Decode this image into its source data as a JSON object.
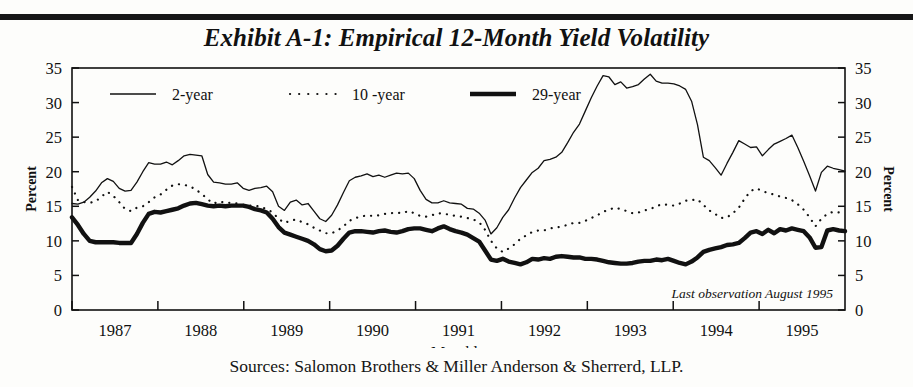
{
  "title": "Exhibit A-1: Empirical 12-Month Yield Volatility",
  "source_note": "Sources: Salomon Brothers & Miller Anderson & Sherrerd, LLP.",
  "annotation": "Last observation August 1995",
  "axis": {
    "y_left_title": "Percent",
    "y_right_title": "Percent",
    "x_title": "Monthly",
    "y_ticks": [
      "0",
      "5",
      "10",
      "15",
      "20",
      "25",
      "30",
      "35"
    ],
    "x_ticks": [
      "1987",
      "1988",
      "1989",
      "1990",
      "1991",
      "1992",
      "1993",
      "1994",
      "1995"
    ]
  },
  "legend": {
    "items": [
      {
        "label": "2-year",
        "style": "thin-solid"
      },
      {
        "label": "10 -year",
        "style": "dotted"
      },
      {
        "label": "29-year",
        "style": "thick-solid"
      }
    ]
  },
  "colors": {
    "ink": "#111111",
    "paper": "#fdfdfb",
    "rule": "#171717"
  },
  "chart_data": {
    "type": "line",
    "title": "Exhibit A-1: Empirical 12-Month Yield Volatility",
    "xlabel": "Monthly",
    "ylabel": "Percent",
    "ylim": [
      0,
      35
    ],
    "grid": false,
    "legend_position": "top-inside",
    "annotations": [
      "Last observation August 1995"
    ],
    "x_tick_labels": [
      "1987",
      "1988",
      "1989",
      "1990",
      "1991",
      "1992",
      "1993",
      "1994",
      "1995"
    ],
    "x_start": "1986-08",
    "x_end": "1995-08",
    "x_step": "1 month",
    "series": [
      {
        "name": "2-year",
        "values": [
          15.4,
          15.3,
          15.6,
          16.3,
          17.2,
          18.4,
          19.0,
          18.6,
          17.6,
          17.2,
          17.3,
          18.5,
          20.0,
          21.3,
          21.1,
          21.1,
          21.4,
          21.0,
          21.6,
          22.3,
          22.5,
          22.4,
          22.3,
          19.6,
          18.5,
          18.4,
          18.2,
          18.2,
          18.4,
          17.6,
          17.3,
          17.6,
          17.7,
          17.9,
          17.1,
          15.0,
          14.4,
          15.6,
          15.9,
          15.2,
          15.4,
          14.3,
          13.2,
          12.8,
          13.7,
          15.2,
          17.0,
          18.7,
          19.2,
          19.4,
          19.7,
          19.3,
          19.5,
          19.2,
          19.5,
          19.8,
          19.7,
          19.8,
          19.0,
          17.3,
          16.0,
          15.5,
          15.5,
          15.8,
          15.5,
          15.4,
          15.3,
          14.7,
          14.6,
          14.0,
          13.0,
          11.0,
          11.9,
          13.4,
          14.5,
          16.2,
          17.7,
          18.8,
          19.9,
          20.5,
          21.6,
          21.8,
          22.1,
          22.8,
          24.2,
          25.7,
          26.9,
          28.8,
          30.7,
          32.4,
          33.9,
          33.7,
          32.6,
          33.0,
          32.1,
          32.3,
          32.6,
          33.4,
          34.1,
          33.1,
          32.8,
          32.8,
          32.7,
          32.4,
          31.9,
          30.2,
          26.8,
          22.1,
          21.6,
          20.6,
          19.5,
          21.2,
          22.8,
          24.5,
          24.0,
          23.5,
          23.6,
          22.3,
          23.2,
          24.0,
          24.4,
          24.8,
          25.3,
          23.5,
          21.5,
          19.4,
          17.2,
          19.9,
          20.8,
          20.5,
          20.3,
          20.1
        ]
      },
      {
        "name": "10 -year",
        "values": [
          17.8,
          15.9,
          15.6,
          15.5,
          15.7,
          16.4,
          17.1,
          16.5,
          15.6,
          14.6,
          14.3,
          14.8,
          15.0,
          15.6,
          16.3,
          16.7,
          17.4,
          18.0,
          18.2,
          18.1,
          17.9,
          17.4,
          16.8,
          16.0,
          15.4,
          15.7,
          15.5,
          15.5,
          15.4,
          15.2,
          15.1,
          15.1,
          14.9,
          14.6,
          14.1,
          13.2,
          12.6,
          12.9,
          13.1,
          12.7,
          12.4,
          11.9,
          11.5,
          11.1,
          11.1,
          11.5,
          12.1,
          12.9,
          13.3,
          13.5,
          13.7,
          13.6,
          13.7,
          13.9,
          14.0,
          14.1,
          14.0,
          14.3,
          14.0,
          13.6,
          13.5,
          13.7,
          14.0,
          13.9,
          13.8,
          13.6,
          13.5,
          13.3,
          13.1,
          12.7,
          11.6,
          10.0,
          8.9,
          8.4,
          8.9,
          9.5,
          10.3,
          10.8,
          11.3,
          11.5,
          11.5,
          11.8,
          11.9,
          12.1,
          12.3,
          12.6,
          12.6,
          12.9,
          13.3,
          13.7,
          14.2,
          14.5,
          14.8,
          14.6,
          14.3,
          14.0,
          14.1,
          14.4,
          14.6,
          15.0,
          15.3,
          15.2,
          15.1,
          15.4,
          15.8,
          15.9,
          16.0,
          15.2,
          14.4,
          13.9,
          13.3,
          13.4,
          14.0,
          14.8,
          16.1,
          17.2,
          17.6,
          17.2,
          16.9,
          16.7,
          16.4,
          16.2,
          15.9,
          15.3,
          14.5,
          13.4,
          12.1,
          13.2,
          13.9,
          14.2,
          14.1,
          13.9
        ]
      },
      {
        "name": "29-year",
        "values": [
          13.4,
          12.3,
          11.0,
          10.0,
          9.8,
          9.8,
          9.8,
          9.8,
          9.7,
          9.7,
          9.7,
          11.0,
          12.6,
          13.9,
          14.2,
          14.1,
          14.3,
          14.5,
          14.7,
          15.1,
          15.4,
          15.5,
          15.3,
          15.1,
          15.0,
          15.1,
          15.0,
          15.1,
          15.1,
          15.1,
          14.9,
          14.6,
          14.4,
          14.1,
          13.2,
          12.0,
          11.2,
          10.9,
          10.6,
          10.3,
          10.0,
          9.5,
          8.8,
          8.5,
          8.6,
          9.3,
          10.3,
          11.2,
          11.4,
          11.4,
          11.3,
          11.2,
          11.4,
          11.5,
          11.3,
          11.2,
          11.4,
          11.7,
          11.8,
          11.8,
          11.6,
          11.4,
          11.8,
          12.1,
          11.7,
          11.4,
          11.2,
          10.9,
          10.4,
          9.9,
          8.6,
          7.3,
          7.1,
          7.4,
          7.0,
          6.8,
          6.6,
          6.9,
          7.4,
          7.3,
          7.5,
          7.4,
          7.7,
          7.8,
          7.7,
          7.6,
          7.6,
          7.4,
          7.4,
          7.3,
          7.1,
          6.9,
          6.8,
          6.7,
          6.7,
          6.8,
          7.0,
          7.1,
          7.1,
          7.3,
          7.2,
          7.4,
          7.1,
          6.8,
          6.6,
          7.0,
          7.6,
          8.4,
          8.7,
          8.9,
          9.1,
          9.4,
          9.5,
          9.7,
          10.4,
          11.2,
          11.4,
          11.0,
          11.6,
          11.1,
          11.7,
          11.5,
          11.8,
          11.6,
          11.4,
          10.5,
          9.0,
          9.1,
          11.5,
          11.7,
          11.5,
          11.4
        ]
      }
    ]
  }
}
